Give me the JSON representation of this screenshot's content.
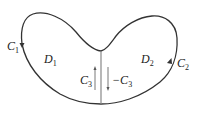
{
  "diagram": {
    "type": "region-decomposition",
    "stroke_color": "#333333",
    "divider_color": "#888888",
    "labels": {
      "c1": {
        "base": "C",
        "sub": "1"
      },
      "c2": {
        "base": "C",
        "sub": "2"
      },
      "c3": {
        "base": "C",
        "sub": "3"
      },
      "neg_c3": {
        "prefix": "−",
        "base": "C",
        "sub": "3"
      },
      "d1": {
        "base": "D",
        "sub": "1"
      },
      "d2": {
        "base": "D",
        "sub": "2"
      }
    },
    "arrows": {
      "c1": "down",
      "c2": "up",
      "c3": "up",
      "neg_c3": "down"
    }
  }
}
